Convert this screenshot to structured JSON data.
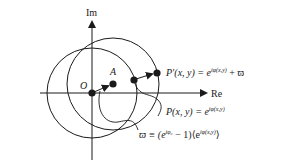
{
  "axes": {
    "imaginary_label": "Im",
    "real_label": "Re"
  },
  "points": {
    "origin_label": "O",
    "a_label": "A"
  },
  "equations": {
    "p_prime": "P′(x, y) = e^{iφ(x,y)} + ϖ",
    "p_prime_lhs": "P′(x, y) = e",
    "p_prime_exp": "iφ(x,y)",
    "p_prime_tail": " + ϖ",
    "p": "P(x, y) = e^{iφ(x,y)}",
    "p_lhs": "P(x, y) = e",
    "p_exp": "iφ(x,y)",
    "varpi": "ϖ ≡ (e^{iφ₀} − 1)⟨e^{iφ(x,y)}⟩",
    "varpi_lhs": "ϖ ≡ (e",
    "varpi_exp1": "iφ₀",
    "varpi_mid": " − 1)⟨e",
    "varpi_exp2": "iφ(x,y)",
    "varpi_tail": "⟩"
  },
  "colors": {
    "stroke": "#1a1a1a",
    "background": "#ffffff"
  }
}
